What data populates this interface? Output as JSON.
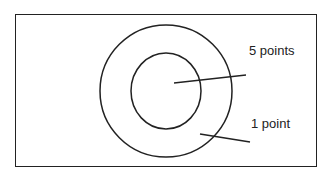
{
  "diagram": {
    "type": "target",
    "rings": [
      {
        "name": "inner",
        "label": "5 points"
      },
      {
        "name": "outer",
        "label": "1 point"
      }
    ],
    "labels": {
      "inner": "5 points",
      "outer": "1 point"
    },
    "colors": {
      "stroke": "#222222",
      "background": "#ffffff"
    }
  }
}
